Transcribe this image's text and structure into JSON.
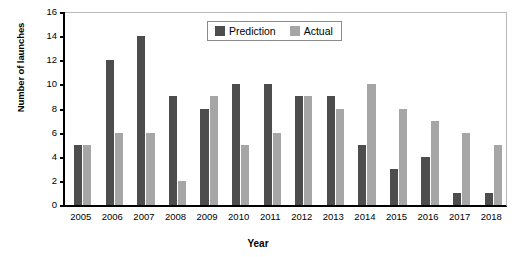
{
  "chart_data": {
    "type": "bar",
    "title": "",
    "xlabel": "Year",
    "ylabel": "Number of launches",
    "categories": [
      "2005",
      "2006",
      "2007",
      "2008",
      "2009",
      "2010",
      "2011",
      "2012",
      "2013",
      "2014",
      "2015",
      "2016",
      "2017",
      "2018"
    ],
    "series": [
      {
        "name": "Prediction",
        "color": "#4d4d4d",
        "values": [
          5,
          12,
          14,
          9,
          8,
          10,
          10,
          9,
          9,
          5,
          3,
          4,
          1,
          1
        ]
      },
      {
        "name": "Actual",
        "color": "#a6a6a6",
        "values": [
          5,
          6,
          6,
          2,
          9,
          5,
          6,
          9,
          8,
          10,
          8,
          7,
          6,
          5
        ]
      }
    ],
    "ylim": [
      0,
      16
    ],
    "yticks": [
      0,
      2,
      4,
      6,
      8,
      10,
      12,
      14,
      16
    ],
    "grid": false,
    "legend_position": "top-center"
  },
  "axes": {
    "y_title": "Number of launches",
    "x_title": "Year"
  },
  "legend": {
    "entries": [
      {
        "label": "Prediction",
        "color": "#4d4d4d"
      },
      {
        "label": "Actual",
        "color": "#a6a6a6"
      }
    ]
  }
}
